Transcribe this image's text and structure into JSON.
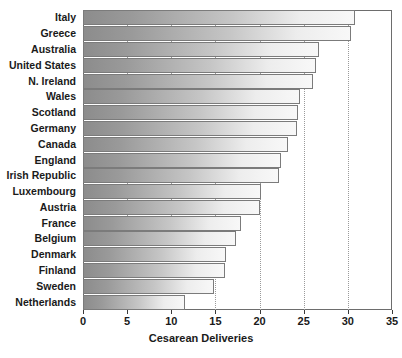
{
  "chart_data": {
    "type": "bar",
    "orientation": "horizontal",
    "title": "",
    "xlabel": "Cesarean Deliveries",
    "ylabel": "",
    "xlim": [
      0,
      35
    ],
    "xticks": [
      0,
      5,
      10,
      15,
      20,
      25,
      30,
      35
    ],
    "xtick_labels": [
      "0",
      "5",
      "10",
      "15",
      "20",
      "25",
      "30",
      "35"
    ],
    "grid": "vertical-dotted",
    "legend": "none",
    "categories": [
      "Italy",
      "Greece",
      "Australia",
      "United States",
      "N. Ireland",
      "Wales",
      "Scotland",
      "Germany",
      "Canada",
      "England",
      "Irish Republic",
      "Luxembourg",
      "Austria",
      "France",
      "Belgium",
      "Denmark",
      "Finland",
      "Sweden",
      "Netherlands"
    ],
    "values": [
      30.8,
      30.4,
      26.7,
      26.4,
      26.1,
      24.6,
      24.3,
      24.2,
      23.2,
      22.4,
      22.2,
      20.2,
      20.0,
      17.9,
      17.3,
      16.2,
      16.1,
      14.8,
      11.6
    ],
    "bar_gradient_start": "#8c8c8c",
    "bar_gradient_end": "#f8f8f8",
    "bar_border_color": "#7b7b7b",
    "frame_color": "#6d6d6d",
    "gridline_color": "#9a9a9a",
    "text_color": "#1a1a1a"
  }
}
